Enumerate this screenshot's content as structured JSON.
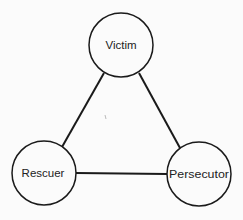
{
  "diagram": {
    "type": "triangle-relationship",
    "colors": {
      "stroke": "#1a1a1a",
      "background": "#fbfbfb",
      "text": "#222222"
    },
    "nodes": [
      {
        "id": "victim",
        "label": "Victim",
        "cx": 121,
        "cy": 45,
        "r": 32
      },
      {
        "id": "rescuer",
        "label": "Rescuer",
        "cx": 44,
        "cy": 173,
        "r": 32
      },
      {
        "id": "persecutor",
        "label": "Persecutor",
        "cx": 199,
        "cy": 174,
        "r": 32
      }
    ],
    "edges": [
      {
        "from": "victim",
        "to": "rescuer"
      },
      {
        "from": "victim",
        "to": "persecutor"
      },
      {
        "from": "rescuer",
        "to": "persecutor"
      }
    ]
  }
}
